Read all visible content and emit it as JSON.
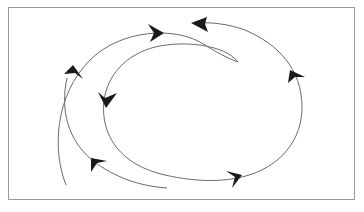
{
  "diagram": {
    "title": "",
    "colors": {
      "background": "#ffffff",
      "frame_border": "#9a9a9a",
      "curve_stroke": "#6b6b6b",
      "arrowhead_fill": "#1a1a1a"
    },
    "curves": [
      {
        "id": "outer-top-arc",
        "label": ""
      },
      {
        "id": "outer-right-arc",
        "label": ""
      },
      {
        "id": "inner-spiral",
        "label": ""
      },
      {
        "id": "outer-left-arc",
        "label": ""
      }
    ],
    "arrowheads": [
      {
        "id": "arrow-top-right",
        "direction": "right"
      },
      {
        "id": "arrow-top-left",
        "direction": "left"
      },
      {
        "id": "arrow-left-up",
        "direction": "up"
      },
      {
        "id": "arrow-inner-down",
        "direction": "down"
      },
      {
        "id": "arrow-right-up",
        "direction": "up"
      },
      {
        "id": "arrow-bottom-left",
        "direction": "up-left"
      },
      {
        "id": "arrow-bottom-right",
        "direction": "right"
      }
    ]
  }
}
